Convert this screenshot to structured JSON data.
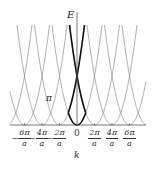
{
  "figure": {
    "type": "empty-lattice band structure",
    "y_axis_label": "E",
    "x_axis_label": "k",
    "origin_label": "0",
    "gap_annotation": "π",
    "tick_labels": [
      {
        "sign": "−",
        "num": "6π",
        "den": "a",
        "k": -6
      },
      {
        "sign": "−",
        "num": "4π",
        "den": "a",
        "k": -4
      },
      {
        "sign": "−",
        "num": "2π",
        "den": "a",
        "k": -2
      },
      {
        "sign": "",
        "num": "2π",
        "den": "a",
        "k": 2
      },
      {
        "sign": "",
        "num": "4π",
        "den": "a",
        "k": 4
      },
      {
        "sign": "",
        "num": "6π",
        "den": "a",
        "k": 6
      }
    ],
    "parabola_centers_in_units_of_2pi_over_a": [
      -4,
      -3,
      -2,
      -1,
      0,
      1,
      2,
      3,
      4
    ],
    "highlighted_zone": "first Brillouin zone (-π/a to π/a), bold",
    "colors": {
      "thin_curve": "#8a8a8a",
      "bold_curve": "#111111",
      "axis": "#555555",
      "text": "#222222"
    }
  }
}
